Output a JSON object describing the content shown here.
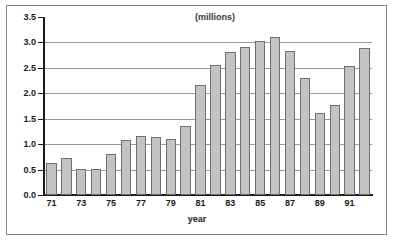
{
  "chart_data": {
    "type": "bar",
    "title": "(millions)",
    "xlabel": "year",
    "ylabel": "",
    "categories": [
      "71",
      "72",
      "73",
      "74",
      "75",
      "76",
      "77",
      "78",
      "79",
      "80",
      "81",
      "82",
      "83",
      "84",
      "85",
      "86",
      "87",
      "88",
      "89",
      "90",
      "91",
      "92"
    ],
    "values": [
      0.63,
      0.72,
      0.52,
      0.52,
      0.8,
      1.09,
      1.17,
      1.15,
      1.1,
      1.36,
      2.17,
      2.56,
      2.81,
      2.92,
      3.03,
      3.1,
      2.84,
      2.3,
      1.61,
      1.77,
      2.53,
      2.89
    ],
    "ylim": [
      0.0,
      3.5
    ],
    "ytick_values": [
      0.0,
      0.5,
      1.0,
      1.5,
      2.0,
      2.5,
      3.0,
      3.5
    ],
    "ytick_labels": [
      "0.0",
      "0.5",
      "1.0",
      "1.5",
      "2.0",
      "2.5",
      "3.0",
      "3.5"
    ],
    "xtick_labels": [
      "71",
      "73",
      "75",
      "77",
      "79",
      "81",
      "83",
      "85",
      "87",
      "89",
      "91"
    ],
    "xtick_categories": [
      "71",
      "73",
      "75",
      "77",
      "79",
      "81",
      "83",
      "85",
      "87",
      "89",
      "91"
    ],
    "grid": true,
    "grid_axis": "y",
    "legend": false,
    "legend_position": "none",
    "bar_color": "#c3c3c3",
    "bar_edge_color": "#6f6f6f",
    "axis_color": "#1a1a1a",
    "grid_color": "#9a9a9a",
    "frame_color": "#8a8a8a",
    "background_color": "#ffffff"
  }
}
